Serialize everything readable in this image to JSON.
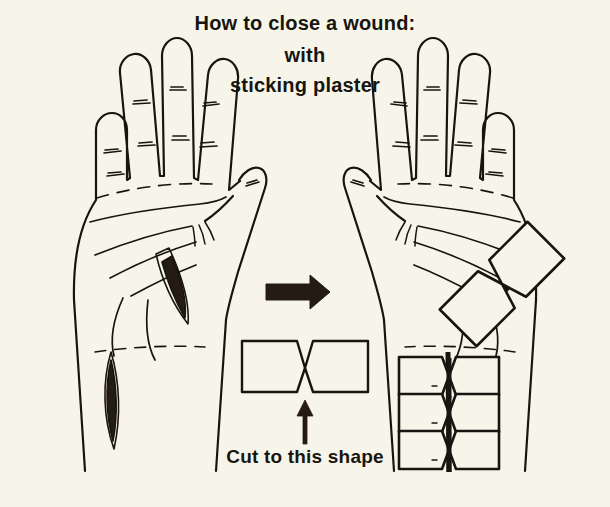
{
  "page": {
    "background_color": "#f7f5ea",
    "ink_color": "#17150f",
    "width": 610,
    "height": 507,
    "kind": "instructional-line-illustration"
  },
  "title": {
    "line_1": "How to close a wound:",
    "line_2": "with",
    "line_3": "sticking plaster"
  },
  "caption": {
    "cut_to_shape": "Cut to this shape"
  },
  "illustration": {
    "left_hand": {
      "label": "open palm with two untreated wounds",
      "wounds": [
        {
          "name": "palm-wound",
          "shape": "lens",
          "fill": "#241b14"
        },
        {
          "name": "wrist-wound",
          "shape": "lens",
          "fill": "#241b14"
        }
      ]
    },
    "right_hand": {
      "label": "open palm with wounds closed by butterfly plasters",
      "plasters_applied": 4
    },
    "plaster_template": {
      "label": "butterfly closure strip",
      "shape": "rectangle with V notches forming a narrow waist"
    },
    "arrows": [
      {
        "name": "arrow-right",
        "direction": "right",
        "meaning": "apply plaster to wound"
      },
      {
        "name": "arrow-up",
        "direction": "up",
        "meaning": "points to the plaster shape"
      }
    ]
  },
  "colors": {
    "paper": "#f7f5ea",
    "ink": "#17150f",
    "wound_fill": "#241b14"
  }
}
